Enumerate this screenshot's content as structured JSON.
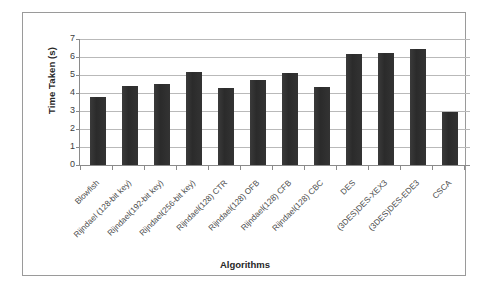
{
  "chart_data": {
    "type": "bar",
    "title": "",
    "xlabel": "Algorithms",
    "ylabel": "Time Taken (s)",
    "ylim": [
      0,
      7
    ],
    "ytick_labels": [
      "7",
      "6",
      "5",
      "4",
      "3",
      "2",
      "1",
      "0"
    ],
    "ytick_values": [
      7,
      6,
      5,
      4,
      3,
      2,
      1,
      0
    ],
    "grid": true,
    "legend": "none",
    "bar_color": "#2f2f2f",
    "categories": [
      "Blowfish",
      "Rijndael (128-bit key)",
      "Rijndael(192-bit key)",
      "Rijndael(256-bit key)",
      "Rijndael(128) CTR",
      "Rijndael(128) OFB",
      "Rijndael(128) CFB",
      "Rijndael(128) CBC",
      "DES",
      "(3DES)DES-XEX3",
      "(3DES)DES-EDE3",
      "CSCA"
    ],
    "values": [
      3.8,
      4.4,
      4.5,
      5.15,
      4.3,
      4.75,
      5.1,
      4.35,
      6.15,
      6.2,
      6.45,
      2.95
    ]
  }
}
